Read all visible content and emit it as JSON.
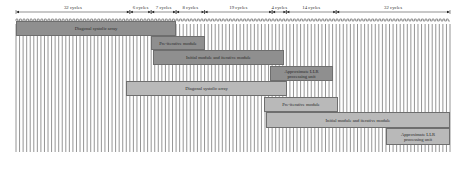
{
  "diagram": {
    "type": "timing-diagram",
    "origin_x": 16,
    "end_x": 450,
    "clock": {
      "y_top": 24,
      "y_bottom": 152,
      "wave_y": 19,
      "total_cycles": 122,
      "color": "#7a7a7a"
    },
    "segments": [
      {
        "label": "32 cycles",
        "cycles": 32
      },
      {
        "label": "6 cycles",
        "cycles": 6
      },
      {
        "label": "7 cycles",
        "cycles": 7
      },
      {
        "label": "8 cycles",
        "cycles": 8
      },
      {
        "label": "19 cycles",
        "cycles": 19
      },
      {
        "label": "4 cycles",
        "cycles": 4
      },
      {
        "label": "14 cycles",
        "cycles": 14
      },
      {
        "label": "32 cycles",
        "cycles": 32
      }
    ],
    "bars": [
      {
        "label": "Diagonal systolic array",
        "shade": "dark",
        "x0": 16,
        "x1": 176,
        "y": 21,
        "h": 15
      },
      {
        "label": "Pre-iterative module",
        "shade": "dark",
        "x0": 151,
        "x1": 205,
        "y": 36,
        "h": 14
      },
      {
        "label": "Initial module and iterative module",
        "shade": "dark",
        "x0": 153,
        "x1": 284,
        "y": 50,
        "h": 15
      },
      {
        "label": "Approximate LLR\nprocessing unit",
        "shade": "dark",
        "x0": 270,
        "x1": 333,
        "y": 66,
        "h": 15
      },
      {
        "label": "Diagonal systolic array",
        "shade": "light",
        "x0": 126,
        "x1": 287,
        "y": 81,
        "h": 15
      },
      {
        "label": "Pre-iterative module",
        "shade": "light",
        "x0": 264,
        "x1": 338,
        "y": 97,
        "h": 15
      },
      {
        "label": "Initial module and iterative module",
        "shade": "light",
        "x0": 266,
        "x1": 450,
        "y": 112,
        "h": 16
      },
      {
        "label": "Approximate LLR\nprocessing unit",
        "shade": "light",
        "x0": 386,
        "x1": 450,
        "y": 128,
        "h": 17
      }
    ],
    "colors": {
      "dark_bar": "#8f8f8f",
      "light_bar": "#b9b9b9",
      "border": "#6e6e6e",
      "arrow": "#222222"
    }
  }
}
